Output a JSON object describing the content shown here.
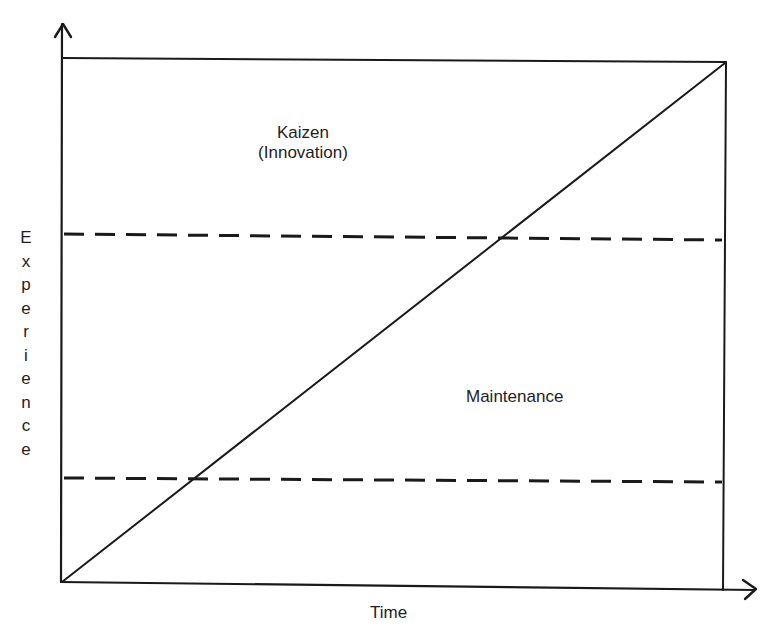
{
  "diagram": {
    "title": "",
    "x_axis": {
      "label": "Time",
      "arrow": "arrow-right"
    },
    "y_axis": {
      "label": "Experience",
      "label_orientation": "vertical-stacked-letters",
      "arrow": "arrow-up"
    },
    "regions": [
      {
        "name": "kaizen",
        "label_line1": "Kaizen",
        "label_line2": "(Innovation)",
        "position": "upper band, above upper dashed line"
      },
      {
        "name": "maintenance",
        "label": "Maintenance",
        "position": "middle band, between dashed lines"
      }
    ],
    "lines": [
      {
        "name": "diagonal",
        "style": "solid",
        "from": [
          62,
          582
        ],
        "to": [
          725,
          62
        ]
      },
      {
        "name": "upper-divider",
        "style": "dashed",
        "from": [
          62,
          234
        ],
        "to": [
          725,
          240
        ]
      },
      {
        "name": "lower-divider",
        "style": "dashed",
        "from": [
          62,
          478
        ],
        "to": [
          725,
          482
        ]
      },
      {
        "name": "top-border",
        "style": "solid",
        "from": [
          62,
          58
        ],
        "to": [
          725,
          62
        ]
      },
      {
        "name": "right-border",
        "style": "solid",
        "from": [
          725,
          62
        ],
        "to": [
          723,
          588
        ]
      }
    ],
    "colors": {
      "line": "#1a1a1a",
      "background": "#ffffff",
      "text": "#1e1e1e"
    }
  },
  "chart_data": {
    "type": "diagram",
    "title": "",
    "xlabel": "Time",
    "ylabel": "Experience",
    "bands": [
      {
        "label": "Kaizen (Innovation)",
        "y_range_fraction": [
          0.66,
          1.0
        ]
      },
      {
        "label": "Maintenance",
        "y_range_fraction": [
          0.2,
          0.66
        ]
      }
    ],
    "diagonal": {
      "from": [
        0,
        0
      ],
      "to": [
        1,
        1
      ],
      "style": "solid"
    },
    "dashed_lines_y_fraction": [
      0.66,
      0.2
    ],
    "grid": false,
    "legend": "none"
  }
}
